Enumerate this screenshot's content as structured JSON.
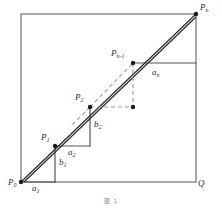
{
  "figure": {
    "caption": "图 1",
    "colors": {
      "square_stroke": "#6f6f6f",
      "step_stroke": "#555555",
      "diagonal_stroke": "#333333",
      "dashed_stroke": "#9a9a9a",
      "point_fill": "#1a1a1a",
      "label_color": "#2b2b2b",
      "background": "#ffffff"
    },
    "square": {
      "x0": 21,
      "y0": 14,
      "x1": 196,
      "y1": 182,
      "description": "bounding square P0 Q and upper edge through Pn"
    },
    "points": [
      {
        "id": "P0",
        "label": "P",
        "sub": "0",
        "x": 21,
        "y": 182,
        "label_dx": -13,
        "label_dy": -4
      },
      {
        "id": "P1",
        "label": "P",
        "sub": "1",
        "x": 55,
        "y": 146,
        "label_dx": -14,
        "label_dy": -13
      },
      {
        "id": "P2",
        "label": "P",
        "sub": "2",
        "x": 90,
        "y": 107,
        "label_dx": -15,
        "label_dy": -14
      },
      {
        "id": "Pn-1",
        "label": "P",
        "sub": "n-1",
        "x": 133,
        "y": 63,
        "label_dx": -22,
        "label_dy": -14
      },
      {
        "id": "Pn",
        "label": "P",
        "sub": "n",
        "x": 196,
        "y": 14,
        "label_dx": 4,
        "label_dy": -11
      },
      {
        "id": "Q",
        "label": "Q",
        "sub": "",
        "x": 196,
        "y": 182,
        "label_dx": 2,
        "label_dy": -3
      },
      {
        "id": "D",
        "label": "",
        "sub": "",
        "x": 133,
        "y": 107,
        "label_dx": 0,
        "label_dy": 0
      }
    ],
    "segment_labels": [
      {
        "id": "a1",
        "label": "a",
        "sub": "1",
        "x": 32,
        "y": 186
      },
      {
        "id": "b1",
        "label": "b",
        "sub": "1",
        "x": 59,
        "y": 162
      },
      {
        "id": "a2",
        "label": "a",
        "sub": "2",
        "x": 68,
        "y": 150
      },
      {
        "id": "b2",
        "label": "b",
        "sub": "2",
        "x": 94,
        "y": 124
      },
      {
        "id": "an",
        "label": "a",
        "sub": "n",
        "x": 152,
        "y": 72
      }
    ],
    "staircase": {
      "description": "solid right-angle steps rising from P0 to P2, plus top step at Pn-1",
      "segments": [
        {
          "from": [
            21,
            182
          ],
          "to": [
            55,
            182
          ]
        },
        {
          "from": [
            55,
            182
          ],
          "to": [
            55,
            146
          ]
        },
        {
          "from": [
            55,
            146
          ],
          "to": [
            90,
            146
          ]
        },
        {
          "from": [
            90,
            146
          ],
          "to": [
            90,
            107
          ]
        },
        {
          "from": [
            133,
            63
          ],
          "to": [
            196,
            63
          ]
        }
      ]
    },
    "diagonals": [
      {
        "from": [
          21,
          182
        ],
        "to": [
          196,
          14
        ],
        "style": "solid"
      },
      {
        "from": [
          23,
          182
        ],
        "to": [
          196,
          16
        ],
        "style": "solid"
      }
    ],
    "dashed": [
      {
        "from": [
          90,
          107
        ],
        "to": [
          133,
          63
        ],
        "style": "dashed"
      },
      {
        "from": [
          133,
          63
        ],
        "to": [
          133,
          107
        ],
        "style": "dashed"
      },
      {
        "from": [
          90,
          107
        ],
        "to": [
          133,
          107
        ],
        "style": "dashed"
      }
    ]
  }
}
